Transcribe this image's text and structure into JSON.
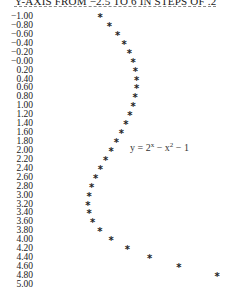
{
  "chart_data": {
    "type": "scatter",
    "title": "Y-AXIS FROM −2.5 TO 6 IN STEPS OF .2",
    "orientation": "rotated: x runs down the rows, y runs across the columns",
    "xlabel": "x",
    "ylabel": "y",
    "xlim": [
      -1.0,
      5.0
    ],
    "ylim": [
      -2.5,
      6
    ],
    "grid": false,
    "marker": "*",
    "annotation": "y = 2^x − x^2 − 1",
    "row_labels": [
      "−1.00",
      "−0.80",
      "−0.60",
      "−0.40",
      "−0.20",
      "−0.00",
      "0.20",
      "0.40",
      "0.60",
      "0.80",
      "1.00",
      "1.20",
      "1.40",
      "1.60",
      "1.80",
      "2.00",
      "2.20",
      "2.40",
      "2.60",
      "2.80",
      "3.00",
      "3.20",
      "3.40",
      "3.60",
      "3.80",
      "4.00",
      "4.20",
      "4.40",
      "4.60",
      "4.80",
      "5.00"
    ],
    "x": [
      -1.0,
      -0.8,
      -0.6,
      -0.4,
      -0.2,
      0.0,
      0.2,
      0.4,
      0.6,
      0.8,
      1.0,
      1.2,
      1.4,
      1.6,
      1.8,
      2.0,
      2.2,
      2.4,
      2.6,
      2.8,
      3.0,
      3.2,
      3.4,
      3.6,
      3.8,
      4.0,
      4.2,
      4.4,
      4.6,
      4.8,
      5.0
    ],
    "y": [
      -1.5,
      -1.07,
      -0.7,
      -0.4,
      -0.17,
      0.0,
      0.11,
      0.16,
      0.16,
      0.1,
      0.0,
      -0.14,
      -0.32,
      -0.53,
      -0.76,
      -1.0,
      -1.25,
      -1.48,
      -1.7,
      -1.88,
      -2.0,
      -2.05,
      -2.0,
      -1.84,
      -1.51,
      -1.0,
      -0.26,
      0.75,
      2.09,
      3.82,
      null
    ]
  },
  "equation": {
    "y": "y = 2",
    "exp1": "x",
    "mid": " − x",
    "exp2": "2",
    "tail": " − 1"
  }
}
